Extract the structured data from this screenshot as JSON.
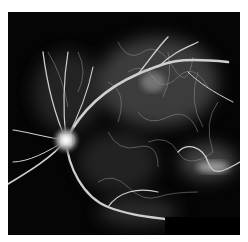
{
  "image": {
    "subject": "retinal fluorescein angiogram",
    "background_color": "#ffffff",
    "frame_color": "#050505",
    "vessel_color": "#d9d9d9",
    "optic_disc_color": "#f2f2f2"
  }
}
